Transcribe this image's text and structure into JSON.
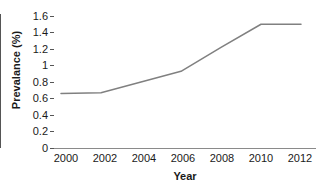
{
  "chart_data": {
    "type": "line",
    "title": "",
    "xlabel": "Year",
    "ylabel": "Prevalance (%)",
    "x": [
      2000,
      2002,
      2004,
      2006,
      2008,
      2010,
      2012
    ],
    "categories": [
      "2000",
      "2002",
      "2004",
      "2006",
      "2008",
      "2010",
      "2012"
    ],
    "values": [
      0.66,
      0.67,
      0.8,
      0.93,
      1.22,
      1.5,
      1.5
    ],
    "series": [
      {
        "name": "Prevalance",
        "values": [
          0.66,
          0.67,
          0.8,
          0.93,
          1.22,
          1.5,
          1.5
        ],
        "color": "#808080"
      }
    ],
    "xlim": [
      2000,
      2012.6
    ],
    "ylim": [
      0,
      1.6
    ],
    "ytick_labels": [
      "0",
      "0.2",
      "0.4",
      "0.6",
      "0.8",
      "1",
      "1.2",
      "1.4",
      "1.6"
    ],
    "ytick_values": [
      0,
      0.2,
      0.4,
      0.6,
      0.8,
      1,
      1.2,
      1.4,
      1.6
    ],
    "xtick_labels": [
      "2000",
      "2002",
      "2004",
      "2006",
      "2008",
      "2010",
      "2012"
    ],
    "xtick_values": [
      2000,
      2002,
      2004,
      2006,
      2008,
      2010,
      2012
    ],
    "grid": false,
    "legend": false,
    "legend_position": "none",
    "markers": false,
    "line_color": "#808080",
    "axis_color": "#555555"
  }
}
